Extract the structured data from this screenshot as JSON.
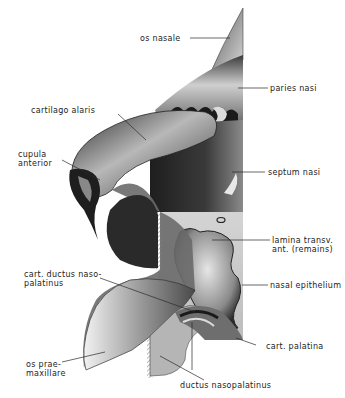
{
  "figure": {
    "type": "anatomical-illustration",
    "colors": {
      "background": "#ffffff",
      "ink": "#1c1c1c",
      "shade_dark": "#2a2a2a",
      "shade_mid": "#7a7a7a",
      "shade_light": "#d9d9d9"
    }
  },
  "labels": [
    {
      "id": "os-nasale",
      "text": "os nasale"
    },
    {
      "id": "paries-nasi",
      "text": "paries nasi"
    },
    {
      "id": "cartilago-alaris",
      "text": "cartilago alaris"
    },
    {
      "id": "cupula-anterior",
      "text": "cupula\nanterior"
    },
    {
      "id": "septum-nasi",
      "text": "septum nasi"
    },
    {
      "id": "lamina-transv",
      "text": "lamina transv.\nant. (remains)"
    },
    {
      "id": "cart-ductus",
      "text": "cart. ductus naso-\npalatinus"
    },
    {
      "id": "nasal-epithelium",
      "text": "nasal epithelium"
    },
    {
      "id": "os-praemaxillare",
      "text": "os prae-\nmaxillare"
    },
    {
      "id": "cart-palatina",
      "text": "cart. palatina"
    },
    {
      "id": "ductus-nasopalatinus",
      "text": "ductus nasopalatinus"
    }
  ]
}
